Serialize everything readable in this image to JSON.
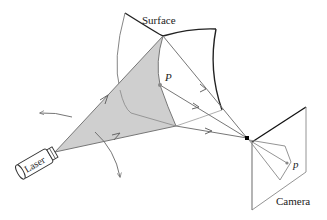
{
  "diagram": {
    "type": "laser-triangulation-3d-scanning",
    "labels": {
      "surface": "Surface",
      "laser": "Laser",
      "camera": "Camera",
      "point_world": "P",
      "point_image": "p"
    },
    "colors": {
      "laser_sheet_fill": "#cfcfcf",
      "ray_stroke": "#777777",
      "surface_edge": "#222222",
      "pinhole": "#000000"
    }
  }
}
